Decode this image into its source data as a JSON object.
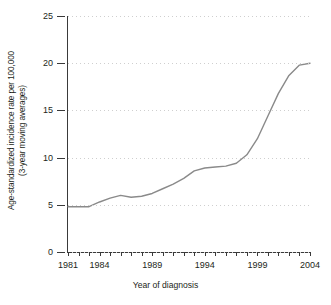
{
  "chart_data": {
    "type": "line",
    "title": "",
    "xlabel": "Year of diagnosis",
    "ylabel_line1": "Age-standardized incidence rate per 100,000",
    "ylabel_line2": "(3-year moving averages)",
    "xlim": [
      1981,
      2004
    ],
    "ylim": [
      0,
      25
    ],
    "yticks": [
      0,
      5,
      10,
      15,
      20,
      25
    ],
    "ytick_labels": [
      "0",
      "5",
      "10",
      "15",
      "20",
      "25"
    ],
    "xticks": [
      1981,
      1982,
      1983,
      1984,
      1985,
      1986,
      1987,
      1988,
      1989,
      1990,
      1991,
      1992,
      1993,
      1994,
      1995,
      1996,
      1997,
      1998,
      1999,
      2000,
      2001,
      2002,
      2003,
      2004
    ],
    "xtick_labels": [
      "1981",
      "1984",
      "1989",
      "1994",
      "1999",
      "2004"
    ],
    "xtick_label_values": [
      1981,
      1984,
      1989,
      1994,
      1999,
      2004
    ],
    "grid": true,
    "grid_axis": "y",
    "legend": "none",
    "line_color": "#8a8a8a",
    "grid_color": "#cfcfcf",
    "axis_color": "#3a3a3a",
    "series": [
      {
        "name": "Age-standardized incidence rate",
        "x": [
          1981,
          1982,
          1983,
          1984,
          1985,
          1986,
          1987,
          1988,
          1989,
          1990,
          1991,
          1992,
          1993,
          1994,
          1995,
          1996,
          1997,
          1998,
          1999,
          2000,
          2001,
          2002,
          2003,
          2004
        ],
        "values": [
          4.8,
          4.8,
          4.8,
          5.3,
          5.7,
          6.0,
          5.8,
          5.9,
          6.2,
          6.7,
          7.2,
          7.8,
          8.6,
          8.9,
          9.0,
          9.1,
          9.4,
          10.3,
          12.0,
          14.4,
          16.8,
          18.7,
          19.8,
          20.0
        ]
      }
    ]
  }
}
